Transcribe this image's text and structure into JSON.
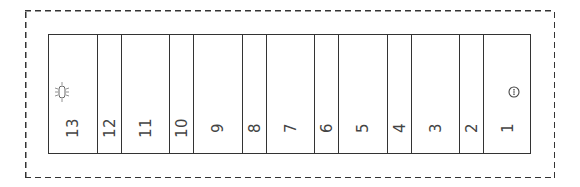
{
  "diagram": {
    "type": "slot-panel",
    "orientation": "labels rotated -90deg",
    "cells": [
      {
        "label": "13",
        "left": 0,
        "width": 49,
        "icon": "lamp-icon"
      },
      {
        "label": "12",
        "left": 49,
        "width": 24
      },
      {
        "label": "11",
        "left": 73,
        "width": 48
      },
      {
        "label": "10",
        "left": 121,
        "width": 24
      },
      {
        "label": "9",
        "left": 145,
        "width": 49
      },
      {
        "label": "8",
        "left": 194,
        "width": 24
      },
      {
        "label": "7",
        "left": 218,
        "width": 48
      },
      {
        "label": "6",
        "left": 266,
        "width": 24
      },
      {
        "label": "5",
        "left": 290,
        "width": 49
      },
      {
        "label": "4",
        "left": 339,
        "width": 24
      },
      {
        "label": "3",
        "left": 363,
        "width": 48
      },
      {
        "label": "2",
        "left": 411,
        "width": 24
      },
      {
        "label": "1",
        "left": 435,
        "width": 48,
        "icon": "circle-indicator-icon"
      }
    ],
    "colors": {
      "line": "#333333",
      "text": "#444444",
      "background": "#ffffff"
    }
  }
}
